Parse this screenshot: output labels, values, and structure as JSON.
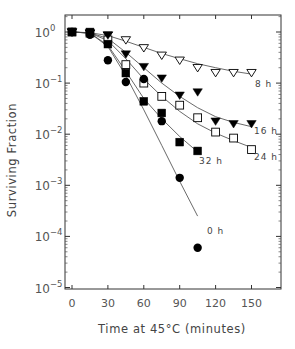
{
  "chart_data": {
    "type": "scatter",
    "title": "",
    "xlabel": "Time at 45°C (minutes)",
    "ylabel": "Surviving Fraction",
    "xscale": "linear",
    "yscale": "log",
    "xlim": [
      -8,
      175
    ],
    "ylim": [
      1e-05,
      3
    ],
    "xticks": [
      0,
      30,
      60,
      90,
      120,
      150
    ],
    "xtick_labels": [
      "0",
      "30",
      "60",
      "90",
      "120",
      "150"
    ],
    "yticks": [
      1,
      0.1,
      0.01,
      0.001,
      0.0001,
      1e-05
    ],
    "ytick_labels": [
      {
        "base": "10",
        "exp": "0"
      },
      {
        "base": "10",
        "exp": "−1"
      },
      {
        "base": "10",
        "exp": "−2"
      },
      {
        "base": "10",
        "exp": "−3"
      },
      {
        "base": "10",
        "exp": "−4"
      },
      {
        "base": "10",
        "exp": "−5"
      }
    ],
    "grid": false,
    "legend": "inline labels at curve ends",
    "series": [
      {
        "name": "8 h",
        "marker": "triangle-down-open",
        "x": [
          0,
          15,
          30,
          45,
          60,
          75,
          90,
          105,
          120,
          135,
          150
        ],
        "values": [
          1.0,
          0.95,
          0.87,
          0.7,
          0.49,
          0.35,
          0.28,
          0.2,
          0.16,
          0.16,
          0.16
        ],
        "fit": [
          [
            0,
            1.0
          ],
          [
            15,
            0.97
          ],
          [
            30,
            0.85
          ],
          [
            45,
            0.66
          ],
          [
            60,
            0.5
          ],
          [
            75,
            0.38
          ],
          [
            90,
            0.3
          ],
          [
            105,
            0.24
          ],
          [
            120,
            0.2
          ],
          [
            135,
            0.17
          ],
          [
            150,
            0.15
          ]
        ],
        "label_pos": [
          255,
          87
        ]
      },
      {
        "name": "16 h",
        "marker": "triangle-down-filled",
        "x": [
          0,
          15,
          30,
          45,
          60,
          75,
          90,
          105,
          120,
          135,
          150
        ],
        "values": [
          1.0,
          0.95,
          0.87,
          0.37,
          0.21,
          0.125,
          0.058,
          0.067,
          0.018,
          0.016,
          0.016
        ],
        "fit": [
          [
            0,
            1.0
          ],
          [
            15,
            0.96
          ],
          [
            30,
            0.75
          ],
          [
            45,
            0.4
          ],
          [
            60,
            0.2
          ],
          [
            75,
            0.1
          ],
          [
            90,
            0.055
          ],
          [
            105,
            0.033
          ],
          [
            120,
            0.022
          ],
          [
            135,
            0.017
          ],
          [
            150,
            0.014
          ]
        ],
        "label_pos": [
          254,
          134
        ]
      },
      {
        "name": "24 h",
        "marker": "square-open",
        "x": [
          0,
          15,
          30,
          45,
          60,
          75,
          90,
          105,
          120,
          135,
          150
        ],
        "values": [
          1.0,
          0.95,
          0.7,
          0.23,
          0.1,
          0.055,
          0.037,
          0.021,
          0.011,
          0.0084,
          0.005
        ],
        "fit": [
          [
            0,
            1.0
          ],
          [
            15,
            0.95
          ],
          [
            30,
            0.68
          ],
          [
            45,
            0.3
          ],
          [
            60,
            0.12
          ],
          [
            75,
            0.055
          ],
          [
            90,
            0.028
          ],
          [
            105,
            0.016
          ],
          [
            120,
            0.0105
          ],
          [
            135,
            0.0075
          ],
          [
            150,
            0.0055
          ]
        ],
        "label_pos": [
          254,
          160
        ]
      },
      {
        "name": "32 h",
        "marker": "square-filled",
        "x": [
          0,
          15,
          30,
          45,
          60,
          75,
          90,
          105
        ],
        "values": [
          1.0,
          1.0,
          0.58,
          0.157,
          0.044,
          0.026,
          0.007,
          0.0047
        ],
        "fit": [
          [
            0,
            1.0
          ],
          [
            15,
            0.95
          ],
          [
            30,
            0.55
          ],
          [
            45,
            0.17
          ],
          [
            60,
            0.05
          ],
          [
            75,
            0.02
          ],
          [
            90,
            0.009
          ],
          [
            105,
            0.0045
          ]
        ],
        "label_pos": [
          199,
          164
        ]
      },
      {
        "name": "0 h",
        "marker": "circle-filled",
        "x": [
          0,
          15,
          30,
          45,
          60,
          75,
          90,
          105
        ],
        "values": [
          1.0,
          0.88,
          0.28,
          0.105,
          0.12,
          0.018,
          0.0014,
          6e-05
        ],
        "fit": [
          [
            0,
            1.0
          ],
          [
            15,
            0.95
          ],
          [
            30,
            0.52
          ],
          [
            45,
            0.14
          ],
          [
            60,
            0.03
          ],
          [
            75,
            0.006
          ],
          [
            90,
            0.0012
          ],
          [
            105,
            0.00025
          ]
        ],
        "label_pos": [
          207,
          234
        ]
      }
    ]
  }
}
